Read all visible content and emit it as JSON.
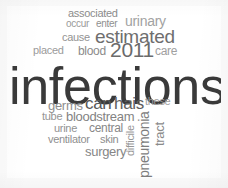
{
  "cloud": {
    "background_color": "#ffffff",
    "page_color": "#fbfbfb",
    "width": 228,
    "height": 188,
    "words": [
      {
        "text": "associated",
        "x": 68,
        "y": 8,
        "size": 11,
        "color": "#8c8c8c",
        "weight": "400",
        "rotation": 0
      },
      {
        "text": "occur",
        "x": 66,
        "y": 19,
        "size": 10,
        "color": "#9a9a9a",
        "weight": "400",
        "rotation": 0
      },
      {
        "text": "enter",
        "x": 96,
        "y": 19,
        "size": 10,
        "color": "#8f8f8f",
        "weight": "400",
        "rotation": 0
      },
      {
        "text": "urinary",
        "x": 125,
        "y": 14,
        "size": 14,
        "color": "#a2a2a2",
        "weight": "400",
        "rotation": 0
      },
      {
        "text": "cause",
        "x": 62,
        "y": 32,
        "size": 11,
        "color": "#939393",
        "weight": "400",
        "rotation": 0
      },
      {
        "text": "estimated",
        "x": 95,
        "y": 27,
        "size": 19,
        "color": "#6e6e6e",
        "weight": "400",
        "rotation": 0
      },
      {
        "text": "placed",
        "x": 33,
        "y": 45,
        "size": 11,
        "color": "#9b9b9b",
        "weight": "400",
        "rotation": 0
      },
      {
        "text": "blood",
        "x": 78,
        "y": 45,
        "size": 12,
        "color": "#8b8b8b",
        "weight": "400",
        "rotation": 0
      },
      {
        "text": "2011",
        "x": 110,
        "y": 39,
        "size": 21,
        "color": "#6b6b6b",
        "weight": "400",
        "rotation": 0
      },
      {
        "text": "care",
        "x": 155,
        "y": 45,
        "size": 12,
        "color": "#a0a0a0",
        "weight": "400",
        "rotation": 0
      },
      {
        "text": "infections",
        "x": 9,
        "y": 60,
        "size": 52,
        "color": "#3a3a3a",
        "weight": "400",
        "rotation": 0
      },
      {
        "text": "germs",
        "x": 48,
        "y": 99,
        "size": 13,
        "color": "#8e8e8e",
        "weight": "400",
        "rotation": 0
      },
      {
        "text": "can",
        "x": 85,
        "y": 95,
        "size": 17,
        "color": "#575757",
        "weight": "400",
        "rotation": 0
      },
      {
        "text": "hais",
        "x": 114,
        "y": 95,
        "size": 17,
        "color": "#5e5e5e",
        "weight": "400",
        "rotation": 0
      },
      {
        "text": "these",
        "x": 145,
        "y": 96,
        "size": 11,
        "color": "#9d9d9d",
        "weight": "400",
        "rotation": 0
      },
      {
        "text": "tube",
        "x": 42,
        "y": 111,
        "size": 11,
        "color": "#949494",
        "weight": "400",
        "rotation": 0
      },
      {
        "text": "bloodstream",
        "x": 66,
        "y": 110,
        "size": 13,
        "color": "#838383",
        "weight": "400",
        "rotation": 0
      },
      {
        "text": "urine",
        "x": 54,
        "y": 123,
        "size": 11,
        "color": "#929292",
        "weight": "400",
        "rotation": 0
      },
      {
        "text": "central",
        "x": 89,
        "y": 122,
        "size": 12,
        "color": "#878787",
        "weight": "400",
        "rotation": 0
      },
      {
        "text": "ventilator",
        "x": 48,
        "y": 134,
        "size": 11,
        "color": "#8f8f8f",
        "weight": "400",
        "rotation": 0
      },
      {
        "text": "skin",
        "x": 100,
        "y": 134,
        "size": 11,
        "color": "#8d8d8d",
        "weight": "400",
        "rotation": 0
      },
      {
        "text": "surgery",
        "x": 85,
        "y": 145,
        "size": 13,
        "color": "#868686",
        "weight": "400",
        "rotation": 0
      },
      {
        "text": "difficile",
        "x": 125,
        "y": 156,
        "size": 11,
        "color": "#979797",
        "weight": "400",
        "rotation": -90
      },
      {
        "text": "pneumonia",
        "x": 137,
        "y": 178,
        "size": 14,
        "color": "#7d7d7d",
        "weight": "400",
        "rotation": -90
      },
      {
        "text": "tract",
        "x": 153,
        "y": 146,
        "size": 13,
        "color": "#8a8a8a",
        "weight": "400",
        "rotation": -90
      }
    ]
  }
}
